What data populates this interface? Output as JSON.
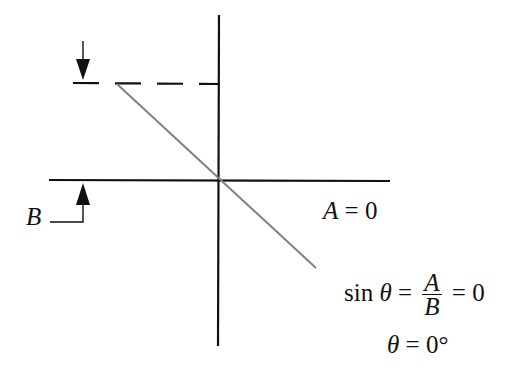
{
  "diagram": {
    "labels": {
      "b_label": "B",
      "a_var": "A",
      "a_eq": "= 0",
      "sin_word": "sin",
      "theta": "θ",
      "eq1": "=",
      "frac_num": "A",
      "frac_den": "B",
      "eq2": "= 0",
      "theta2": "θ",
      "theta_result": "= 0°"
    },
    "colors": {
      "axis": "#111111",
      "vector": "#808080"
    }
  }
}
